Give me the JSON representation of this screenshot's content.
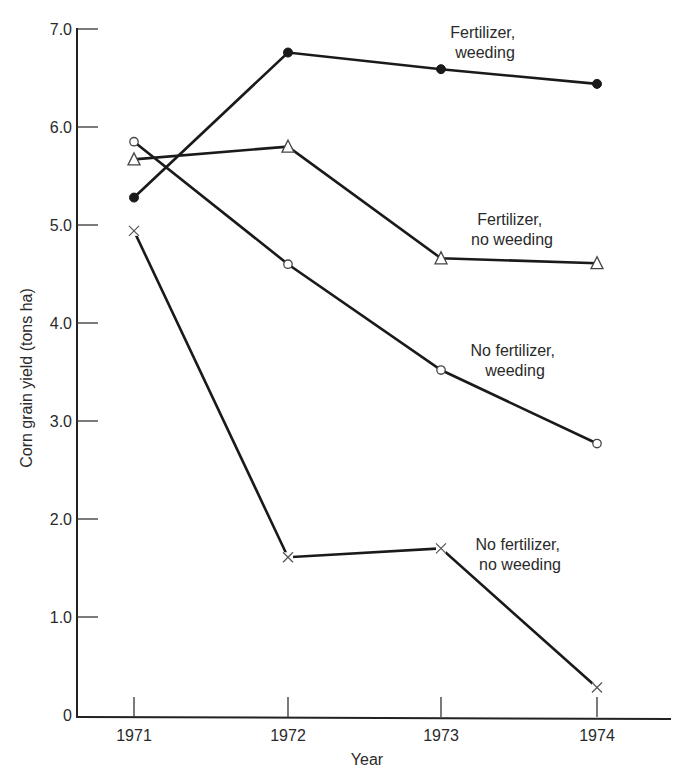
{
  "chart_data": {
    "type": "line",
    "title": "",
    "xlabel": "Year",
    "ylabel": "Corn grain yield (tons ha)",
    "categories": [
      "1971",
      "1972",
      "1973",
      "1974"
    ],
    "ylim": [
      0,
      7.0
    ],
    "yticks": [
      "0",
      "1.0",
      "2.0",
      "3.0",
      "4.0",
      "5.0",
      "6.0",
      "7.0"
    ],
    "ytick_values": [
      0,
      1,
      2,
      3,
      4,
      5,
      6,
      7
    ],
    "grid": false,
    "legend": "inline labels next to series",
    "series": [
      {
        "name": "Fertilizer, weeding",
        "label_lines": [
          "Fertilizer,",
          "weeding"
        ],
        "marker": "filled-circle",
        "values": [
          5.28,
          6.76,
          6.59,
          6.44
        ]
      },
      {
        "name": "Fertilizer, no weeding",
        "label_lines": [
          "Fertilizer,",
          "no weeding"
        ],
        "marker": "open-triangle",
        "values": [
          5.67,
          5.8,
          4.66,
          4.61
        ]
      },
      {
        "name": "No fertilizer, weeding",
        "label_lines": [
          "No fertilizer,",
          "weeding"
        ],
        "marker": "open-circle",
        "values": [
          5.85,
          4.6,
          3.52,
          2.77
        ]
      },
      {
        "name": "No fertilizer, no weeding",
        "label_lines": [
          "No fertilizer,",
          "no weeding"
        ],
        "marker": "cross",
        "values": [
          4.94,
          1.61,
          1.7,
          0.28
        ]
      }
    ]
  },
  "colors": {
    "line": "#1a1a1a",
    "text": "#2a2a2a",
    "background": "#ffffff"
  }
}
